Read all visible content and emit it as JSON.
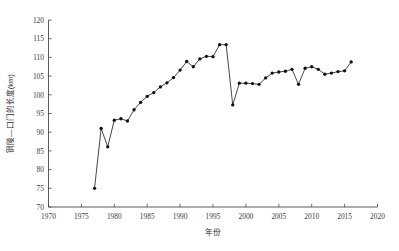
{
  "chart_data": {
    "type": "line",
    "title": "",
    "subtitle": "",
    "xlabel": "年份",
    "ylabel": "铜陵—口门的长度(km)",
    "xlim": [
      1970,
      2020
    ],
    "ylim": [
      70,
      120
    ],
    "xticks": [
      1970,
      1975,
      1980,
      1985,
      1990,
      1995,
      2000,
      2005,
      2010,
      2015,
      2020
    ],
    "xtick_labels": [
      "1970",
      "1975",
      "1980",
      "1985",
      "1990",
      "1995",
      "2000",
      "2005",
      "2010",
      "2015",
      "2020"
    ],
    "yticks": [
      70,
      75,
      80,
      85,
      90,
      95,
      100,
      105,
      110,
      115,
      120
    ],
    "ytick_labels": [
      "70",
      "75",
      "80",
      "85",
      "90",
      "95",
      "100",
      "105",
      "110",
      "115",
      "120"
    ],
    "grid": false,
    "legend": false,
    "legend_position": "none",
    "marker": "filled-circle",
    "line_color": "#262626",
    "marker_color": "#111111",
    "x": [
      1977,
      1978,
      1979,
      1980,
      1981,
      1982,
      1983,
      1984,
      1985,
      1986,
      1987,
      1988,
      1989,
      1990,
      1991,
      1992,
      1993,
      1994,
      1995,
      1996,
      1997,
      1998,
      1999,
      2000,
      2001,
      2002,
      2003,
      2004,
      2005,
      2006,
      2007,
      2008,
      2009,
      2010,
      2011,
      2012,
      2013,
      2014,
      2015,
      2016
    ],
    "values": [
      75.0,
      91.0,
      86.1,
      93.2,
      93.6,
      93.0,
      96.0,
      98.0,
      99.6,
      100.6,
      102.1,
      103.2,
      104.6,
      106.6,
      108.9,
      107.5,
      109.6,
      110.3,
      110.2,
      113.4,
      113.4,
      97.3,
      103.1,
      103.1,
      103.0,
      102.8,
      104.5,
      105.8,
      106.1,
      106.3,
      106.8,
      102.8,
      107.1,
      107.5,
      106.8,
      105.5,
      105.8,
      106.2,
      106.4,
      108.8
    ],
    "series": [
      {
        "name": "铜陵—口门的长度",
        "values": [
          75.0,
          91.0,
          86.1,
          93.2,
          93.6,
          93.0,
          96.0,
          98.0,
          99.6,
          100.6,
          102.1,
          103.2,
          104.6,
          106.6,
          108.9,
          107.5,
          109.6,
          110.3,
          110.2,
          113.4,
          113.4,
          97.3,
          103.1,
          103.1,
          103.0,
          102.8,
          104.5,
          105.8,
          106.1,
          106.3,
          106.8,
          102.8,
          107.1,
          107.5,
          106.8,
          105.5,
          105.8,
          106.2,
          106.4,
          108.8
        ]
      }
    ]
  }
}
